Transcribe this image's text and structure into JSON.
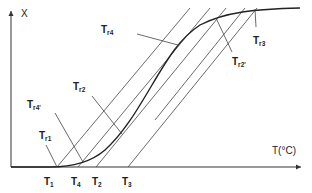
{
  "diagram": {
    "y_axis_label": "X",
    "x_axis_label": "T(°C)",
    "x_ticks": [
      {
        "main": "T",
        "sub": "1"
      },
      {
        "main": "T",
        "sub": "4"
      },
      {
        "main": "T",
        "sub": "2"
      },
      {
        "main": "T",
        "sub": "3"
      }
    ],
    "annotations": [
      {
        "main": "T",
        "sub": "r1"
      },
      {
        "main": "T",
        "sub": "r4'"
      },
      {
        "main": "T",
        "sub": "r2"
      },
      {
        "main": "T",
        "sub": "r4"
      },
      {
        "main": "T",
        "sub": "r2'"
      },
      {
        "main": "T",
        "sub": "r3"
      }
    ],
    "colors": {
      "line": "#333333",
      "curve": "#222222"
    }
  }
}
